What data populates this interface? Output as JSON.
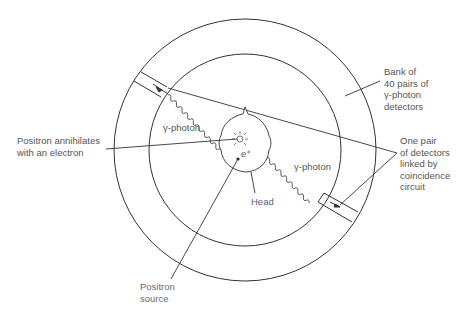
{
  "diagram": {
    "labels": {
      "bank": "Bank of\n40 pairs of\nγ-photon\ndetectors",
      "pair": "One pair\nof detectors\nlinked by\ncoincidence\ncircuit",
      "annihilates": "Positron annihilates\nwith an electron",
      "photon_left": "γ-photon",
      "photon_right": "γ-photon",
      "head": "Head",
      "positron_symbol": "e⁺",
      "source": "Positron\nsource"
    },
    "colors": {
      "line": "#333333",
      "text": "#555555",
      "head_label": "#5a5a8c",
      "background": "#ffffff"
    },
    "geometry": {
      "center": [
        245,
        150
      ],
      "outer_radius": 131,
      "inner_radius": 96,
      "detector_count_pairs": 40
    }
  }
}
